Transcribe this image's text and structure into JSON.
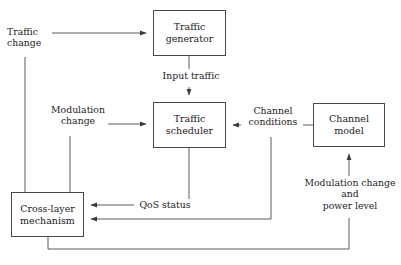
{
  "diagram": {
    "type": "block-diagram",
    "background_color": "#ffffff",
    "line_color": "#4a4a4a",
    "text_color": "#1b1b1b",
    "nodes": [
      {
        "id": "traffic-generator",
        "label": "Traffic\ngenerator",
        "line1": "Traffic",
        "line2": "generator",
        "x": 153,
        "y": 10,
        "w": 73,
        "h": 46
      },
      {
        "id": "traffic-scheduler",
        "label": "Traffic\nscheduler",
        "line1": "Traffic",
        "line2": "scheduler",
        "x": 153,
        "y": 102,
        "w": 73,
        "h": 46
      },
      {
        "id": "channel-model",
        "label": "Channel\nmodel",
        "line1": "Channel",
        "line2": "model",
        "x": 313,
        "y": 103,
        "w": 72,
        "h": 44
      },
      {
        "id": "cross-layer",
        "label": "Cross-layer\nmechanism",
        "line1": "Cross-layer",
        "line2": "mechanism",
        "x": 11,
        "y": 192,
        "w": 73,
        "h": 45
      }
    ],
    "edge_labels": [
      {
        "id": "traffic-change",
        "text": "Traffic\nchange",
        "x": 6,
        "y": 26,
        "w": 44
      },
      {
        "id": "input-traffic",
        "text": "Input traffic",
        "x": 155,
        "y": 70,
        "w": 70
      },
      {
        "id": "modulation-change",
        "text": "Modulation\nchange",
        "x": 48,
        "y": 104,
        "w": 58
      },
      {
        "id": "channel-conditions",
        "text": "Channel\nconditions",
        "x": 243,
        "y": 105,
        "w": 58
      },
      {
        "id": "qos-status",
        "text": "QoS status",
        "x": 136,
        "y": 199,
        "w": 56
      },
      {
        "id": "modulation-and-power",
        "text": "Modulation change\nand\npower level",
        "x": 298,
        "y": 177,
        "w": 102
      }
    ],
    "connections": [
      {
        "from": "traffic-change",
        "to": "traffic-generator",
        "kind": "arrow"
      },
      {
        "from": "traffic-generator",
        "to": "traffic-scheduler",
        "kind": "arrow",
        "label": "Input traffic"
      },
      {
        "from": "modulation-change",
        "to": "traffic-scheduler",
        "kind": "arrow"
      },
      {
        "from": "channel-model",
        "to": "traffic-scheduler",
        "kind": "arrow",
        "label": "Channel conditions"
      },
      {
        "from": "traffic-scheduler",
        "to": "cross-layer",
        "kind": "arrow",
        "label": "QoS status"
      },
      {
        "from": "channel-conditions",
        "to": "cross-layer",
        "kind": "arrow"
      },
      {
        "from": "cross-layer",
        "to": "channel-model",
        "kind": "arrow",
        "label": "Modulation change and power level"
      },
      {
        "from": "traffic-change-tap",
        "to": "cross-layer",
        "kind": "line"
      },
      {
        "from": "modulation-change-tap",
        "to": "cross-layer",
        "kind": "line"
      }
    ]
  }
}
